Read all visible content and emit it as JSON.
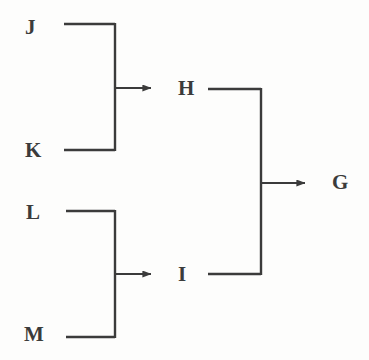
{
  "diagram": {
    "type": "block-flow-diagram",
    "background_color": "#fdfdfc",
    "stroke_color": "#3b3b3b",
    "label_color": "#3b3b3b",
    "nodes": [
      {
        "id": "J",
        "label": "J",
        "x": 25,
        "y": 17
      },
      {
        "id": "K",
        "label": "K",
        "x": 25,
        "y": 140
      },
      {
        "id": "L",
        "label": "L",
        "x": 26,
        "y": 202
      },
      {
        "id": "M",
        "label": "M",
        "x": 24,
        "y": 324
      },
      {
        "id": "H",
        "label": "H",
        "x": 178,
        "y": 78
      },
      {
        "id": "I",
        "label": "I",
        "x": 178,
        "y": 264
      },
      {
        "id": "G",
        "label": "G",
        "x": 332,
        "y": 172
      }
    ],
    "connections": [
      {
        "from": "J",
        "to": "H",
        "kind": "merge-branch"
      },
      {
        "from": "K",
        "to": "H",
        "kind": "merge-branch"
      },
      {
        "from": "L",
        "to": "I",
        "kind": "merge-branch"
      },
      {
        "from": "M",
        "to": "I",
        "kind": "merge-branch"
      },
      {
        "from": "H",
        "to": "G",
        "kind": "merge-branch"
      },
      {
        "from": "I",
        "to": "G",
        "kind": "merge-branch"
      }
    ],
    "junctions": [
      {
        "name": "jk-bus",
        "x": 115,
        "y_top": 24,
        "y_bottom": 150,
        "arrow_y": 88
      },
      {
        "name": "lm-bus",
        "x": 115,
        "y_top": 211,
        "y_bottom": 337,
        "arrow_y": 274
      },
      {
        "name": "hi-bus",
        "x": 261,
        "y_top": 89,
        "y_bottom": 274,
        "arrow_y": 183
      }
    ]
  }
}
